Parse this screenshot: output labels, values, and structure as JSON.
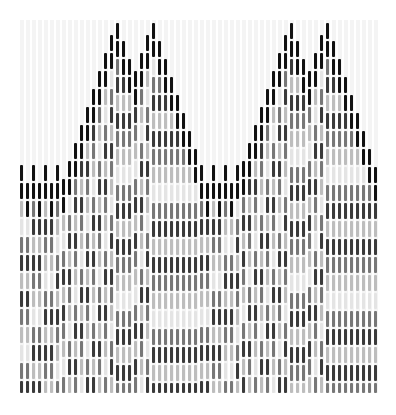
{
  "pattern": {
    "origin_x": 20,
    "column_spacing": 6,
    "columns": 60,
    "row_height": 18,
    "bar_length": 16,
    "bottom_y": 393,
    "base_top_y": 165,
    "peaks": [
      115,
      151,
      289,
      325
    ],
    "peak_top_y": 20,
    "slope_per_column": 18,
    "palette": {
      "edge": "#111111",
      "dark": "#3a3a3a",
      "mid": "#777777",
      "light": "#bdbdbd",
      "faint": "#e4e4e4",
      "background_grid": "#f4f4f4"
    }
  }
}
